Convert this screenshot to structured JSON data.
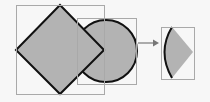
{
  "diagram": {
    "colors": {
      "background": "#f7f7f7",
      "shape_fill": "#b3b3b3",
      "shape_stroke": "#111111",
      "bounding_box": "#a9a9a9",
      "arrow": "#777777"
    },
    "input_shapes": [
      {
        "name": "diamond",
        "bbox": [
          16,
          5,
          104,
          94
        ]
      },
      {
        "name": "circle",
        "center": [
          106,
          51
        ],
        "radius": 31,
        "bbox": [
          77,
          18,
          136,
          84
        ]
      }
    ],
    "operation": "intersect",
    "result_shape": {
      "name": "intersection-lens",
      "bbox": [
        161,
        27,
        194,
        79
      ]
    }
  }
}
